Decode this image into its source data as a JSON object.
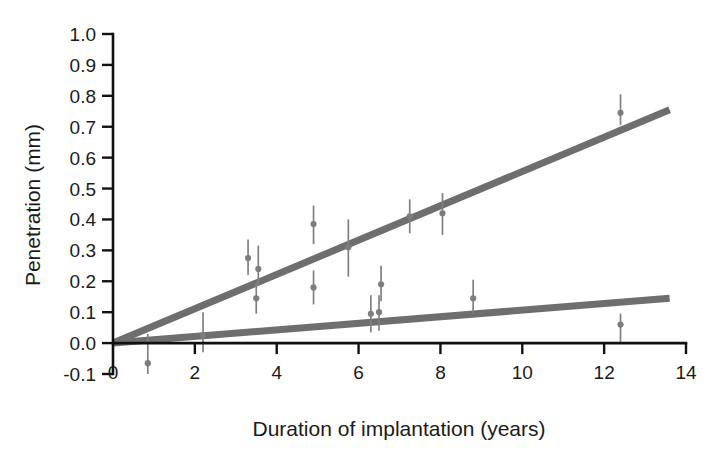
{
  "chart_data": {
    "type": "scatter",
    "title": "",
    "subtitle": "",
    "xlabel": "Duration of implantation (years)",
    "ylabel": "Penetration (mm)",
    "xlim": [
      0,
      14
    ],
    "ylim": [
      -0.1,
      1.0
    ],
    "xticks": [
      0,
      2,
      4,
      6,
      8,
      10,
      12,
      14
    ],
    "xtick_labels": [
      "0",
      "2",
      "4",
      "6",
      "8",
      "10",
      "12",
      "14"
    ],
    "yticks": [
      -0.1,
      0.0,
      0.1,
      0.2,
      0.3,
      0.4,
      0.5,
      0.6,
      0.7,
      0.8,
      0.9,
      1.0
    ],
    "ytick_labels": [
      "-0.1",
      "0.0",
      "0.1",
      "0.2",
      "0.3",
      "0.4",
      "0.5",
      "0.6",
      "0.7",
      "0.8",
      "0.9",
      "1.0"
    ],
    "grid": false,
    "legend": "none",
    "marker_color": "#7d7d7d",
    "errorbar_color": "#808080",
    "line_color": "#6e6e6e",
    "series": [
      {
        "name": "upper-group",
        "points": [
          {
            "x": 3.3,
            "y": 0.275,
            "yerr_low": 0.055,
            "yerr_high": 0.06
          },
          {
            "x": 3.55,
            "y": 0.24,
            "yerr_low": 0.055,
            "yerr_high": 0.075
          },
          {
            "x": 3.5,
            "y": 0.145,
            "yerr_low": 0.05,
            "yerr_high": 0.05
          },
          {
            "x": 4.9,
            "y": 0.385,
            "yerr_low": 0.065,
            "yerr_high": 0.06
          },
          {
            "x": 4.9,
            "y": 0.18,
            "yerr_low": 0.055,
            "yerr_high": 0.055
          },
          {
            "x": 5.75,
            "y": 0.31,
            "yerr_low": 0.095,
            "yerr_high": 0.09
          },
          {
            "x": 6.55,
            "y": 0.19,
            "yerr_low": 0.055,
            "yerr_high": 0.06
          },
          {
            "x": 7.25,
            "y": 0.41,
            "yerr_low": 0.055,
            "yerr_high": 0.055
          },
          {
            "x": 8.05,
            "y": 0.42,
            "yerr_low": 0.07,
            "yerr_high": 0.065
          },
          {
            "x": 12.4,
            "y": 0.745,
            "yerr_low": 0.04,
            "yerr_high": 0.06
          }
        ]
      },
      {
        "name": "lower-group",
        "points": [
          {
            "x": 0.85,
            "y": -0.065,
            "yerr_low": 0.035,
            "yerr_high": 0.095
          },
          {
            "x": 2.2,
            "y": 0.025,
            "yerr_low": 0.055,
            "yerr_high": 0.075
          },
          {
            "x": 6.3,
            "y": 0.095,
            "yerr_low": 0.06,
            "yerr_high": 0.06
          },
          {
            "x": 6.5,
            "y": 0.1,
            "yerr_low": 0.06,
            "yerr_high": 0.055
          },
          {
            "x": 8.8,
            "y": 0.145,
            "yerr_low": 0.05,
            "yerr_high": 0.06
          },
          {
            "x": 12.4,
            "y": 0.06,
            "yerr_low": 0.06,
            "yerr_high": 0.035
          }
        ]
      }
    ],
    "fit_lines": [
      {
        "name": "upper-fit",
        "x0": 0.0,
        "y0": 0.0,
        "x1": 13.6,
        "y1": 0.755,
        "slope": 0.0555,
        "intercept": 0.0
      },
      {
        "name": "lower-fit",
        "x0": 0.0,
        "y0": 0.0,
        "x1": 13.6,
        "y1": 0.145,
        "slope": 0.0107,
        "intercept": 0.0
      }
    ]
  }
}
